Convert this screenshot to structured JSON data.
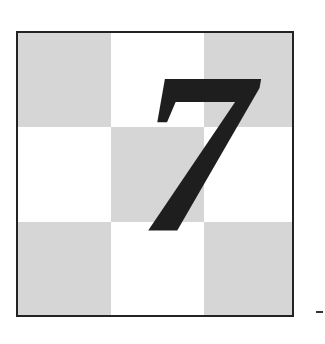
{
  "figure": {
    "digit": "7",
    "grid": {
      "rows": 3,
      "cols": 3,
      "pattern": [
        "shade",
        "plain",
        "shade",
        "plain",
        "shade",
        "plain",
        "shade",
        "plain",
        "shade"
      ]
    },
    "colors": {
      "shade": "#d6d6d6",
      "plain": "#ffffff",
      "border": "#222222",
      "digit": "#1e1e1e"
    }
  }
}
